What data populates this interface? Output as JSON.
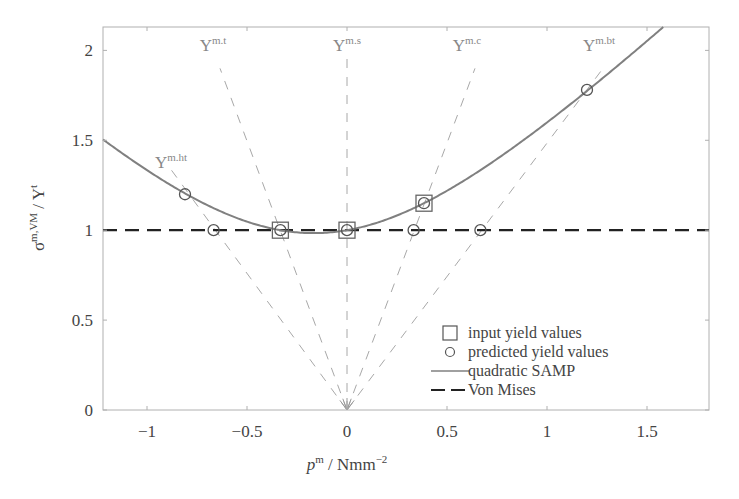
{
  "chart_data": {
    "type": "line",
    "title": "",
    "xlabel": "p^m / Nmm^-2",
    "xlabel_parts": {
      "var": "p",
      "var_sup": "m",
      "unit": " / Nmm",
      "unit_sup": "−2"
    },
    "ylabel": "σ^{m,VM} / Y^t",
    "ylabel_parts": {
      "sym": "σ",
      "sym_sup": "m,VM",
      "div": " / Y",
      "div_sup": "t"
    },
    "xlim": [
      -1.22,
      1.81
    ],
    "ylim": [
      0,
      2.13
    ],
    "x_ticks": [
      -1,
      -0.5,
      0,
      0.5,
      1,
      1.5
    ],
    "x_tick_labels": [
      "−1",
      "−0.5",
      "0",
      "0.5",
      "1",
      "1.5"
    ],
    "y_ticks": [
      0,
      0.5,
      1,
      1.5,
      2
    ],
    "y_tick_labels": [
      "0",
      "0.5",
      "1",
      "1.5",
      "2"
    ],
    "grid": false,
    "legend_position": "lower right",
    "series": [
      {
        "name": "input yield values",
        "type": "scatter",
        "marker": "square",
        "points": [
          [
            -0.333,
            1.0
          ],
          [
            0.0,
            1.0
          ],
          [
            0.385,
            1.15
          ]
        ]
      },
      {
        "name": "predicted yield values",
        "type": "scatter",
        "marker": "circle",
        "points": [
          [
            -0.81,
            1.2
          ],
          [
            -0.667,
            1.0
          ],
          [
            -0.333,
            1.0
          ],
          [
            0.0,
            1.0
          ],
          [
            0.333,
            1.0
          ],
          [
            0.385,
            1.15
          ],
          [
            0.667,
            1.0
          ],
          [
            1.2,
            1.78
          ]
        ]
      },
      {
        "name": "quadratic SAMP",
        "type": "line",
        "style": "solid",
        "color": "#808080",
        "equation": "y^2 = 1 + 0.389 x + 1.168 x^2",
        "coefficients": {
          "a": 1.0,
          "b": 0.389,
          "c": 1.168
        },
        "x_range": [
          -1.22,
          1.6
        ]
      },
      {
        "name": "Von Mises",
        "type": "line",
        "style": "dashed",
        "color": "#222222",
        "points": [
          [
            -1.22,
            1.0
          ],
          [
            1.81,
            1.0
          ]
        ]
      }
    ],
    "rays": [
      {
        "label": "Y",
        "sup": "m.ht",
        "through": [
          -0.81,
          1.2
        ],
        "end": [
          -0.895,
          1.36
        ],
        "label_pos": [
          -0.88,
          1.38
        ]
      },
      {
        "label": "Y",
        "sup": "m.t",
        "through": [
          -0.333,
          1.0
        ],
        "end": [
          -0.635,
          1.9
        ],
        "label_pos": [
          -0.67,
          2.03
        ]
      },
      {
        "label": "Y",
        "sup": "m.s",
        "through": [
          0.0,
          1.0
        ],
        "end": [
          0.0,
          2.0
        ],
        "label_pos": [
          0.0,
          2.03
        ]
      },
      {
        "label": "Y",
        "sup": "m.c",
        "through": [
          0.385,
          1.15
        ],
        "end": [
          0.64,
          1.9
        ],
        "label_pos": [
          0.6,
          2.03
        ]
      },
      {
        "label": "Y",
        "sup": "m.bt",
        "through": [
          1.2,
          1.78
        ],
        "end": [
          1.28,
          1.9
        ],
        "label_pos": [
          1.26,
          2.03
        ]
      }
    ],
    "ray_origin": [
      0,
      0
    ],
    "annotations": [
      "Y^m.ht",
      "Y^m.t",
      "Y^m.s",
      "Y^m.c",
      "Y^m.bt"
    ]
  },
  "legend": {
    "items": [
      {
        "label": "input yield values",
        "symbol": "square"
      },
      {
        "label": "predicted yield values",
        "symbol": "circle"
      },
      {
        "label": "quadratic SAMP",
        "symbol": "solid-line"
      },
      {
        "label": "Von Mises",
        "symbol": "dashed-line"
      }
    ]
  },
  "colors": {
    "axis": "#b0b0b0",
    "curve": "#808080",
    "von_mises": "#222222",
    "rays": "#a8a8a8",
    "markers_input": "#666666",
    "markers_predicted": "#555555",
    "text": "#444444"
  }
}
